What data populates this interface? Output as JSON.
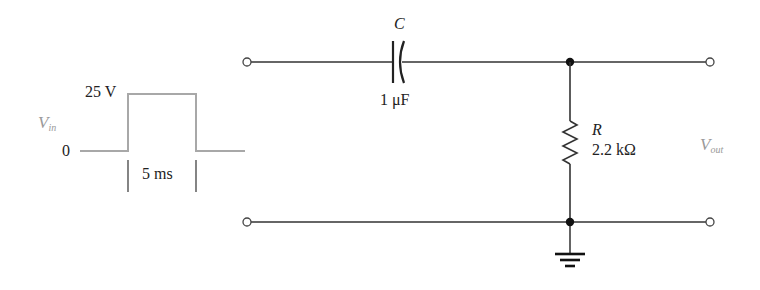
{
  "input_waveform": {
    "signal_label": "V",
    "signal_subscript": "in",
    "high_level": "25 V",
    "low_level": "0",
    "pulse_width": "5 ms",
    "color": "#a8a8a8"
  },
  "capacitor": {
    "designator": "C",
    "value": "1 μF"
  },
  "resistor": {
    "designator": "R",
    "value": "2.2 kΩ"
  },
  "output": {
    "signal_label": "V",
    "signal_subscript": "out",
    "color": "#9a9a9a"
  },
  "wire_color": "#333333"
}
